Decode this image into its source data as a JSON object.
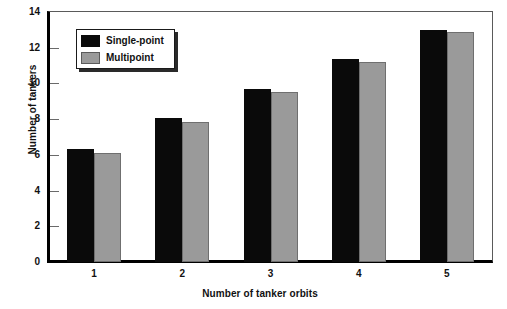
{
  "chart_data": {
    "type": "bar",
    "title": "",
    "subtitle": "",
    "xlabel": "Number of tanker orbits",
    "ylabel": "Number of tankers",
    "categories": [
      "1",
      "2",
      "3",
      "4",
      "5"
    ],
    "series": [
      {
        "name": "Single-point",
        "color": "#0a0a0a",
        "values": [
          6.35,
          8.05,
          9.7,
          11.35,
          13.0
        ]
      },
      {
        "name": "Multipoint",
        "color": "#9a9a9a",
        "values": [
          6.1,
          7.85,
          9.5,
          11.2,
          12.9
        ]
      }
    ],
    "ylim": [
      0,
      14
    ],
    "ytick_step": 2,
    "yticks": [
      "0",
      "2",
      "4",
      "6",
      "8",
      "10",
      "12",
      "14"
    ],
    "grid": false,
    "legend_position": "top-left",
    "annotations": []
  },
  "legend": {
    "entries": [
      {
        "label": "Single-point",
        "color": "#0a0a0a"
      },
      {
        "label": "Multipoint",
        "color": "#9a9a9a"
      }
    ]
  },
  "colors": {
    "single_point": "#0a0a0a",
    "multipoint": "#9a9a9a",
    "axis": "#000000",
    "frame": "#5a5a5a",
    "background": "#ffffff",
    "text": "#111111"
  }
}
